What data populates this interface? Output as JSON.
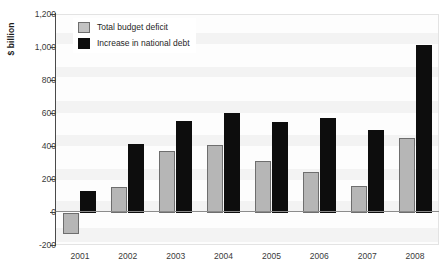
{
  "chart_data": {
    "type": "bar",
    "title": "",
    "subtitle": "",
    "xlabel": "",
    "ylabel": "$ billion",
    "categories": [
      "2001",
      "2002",
      "2003",
      "2004",
      "2005",
      "2006",
      "2007",
      "2008"
    ],
    "series": [
      {
        "name": "Total budget deficit",
        "color": "#b6b6b6",
        "values": [
          -128,
          158,
          378,
          413,
          318,
          248,
          162,
          455
        ]
      },
      {
        "name": "Increase in national debt",
        "color": "#0d0d0d",
        "values": [
          133,
          420,
          555,
          605,
          553,
          574,
          501,
          1017
        ]
      }
    ],
    "ylim": [
      -200,
      1200
    ],
    "ytick_step": 200,
    "ytick_labels": [
      "1,200",
      "1,000",
      "800",
      "600",
      "400",
      "200",
      "0",
      "-200"
    ],
    "ytick_values": [
      1200,
      1000,
      800,
      600,
      400,
      200,
      0,
      -200
    ],
    "grid": false,
    "legend_position": "top-left",
    "zero_line": true
  },
  "axis": {
    "y_title": "$ billion"
  },
  "legend": {
    "items": [
      {
        "label": "Total budget deficit",
        "swatch": "deficit"
      },
      {
        "label": "Increase in national debt",
        "swatch": "debt"
      }
    ]
  }
}
